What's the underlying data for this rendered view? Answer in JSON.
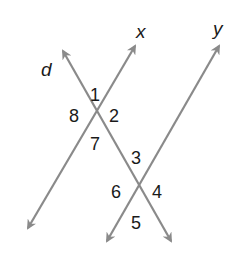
{
  "diagram": {
    "line_color": "#8a8a8a",
    "text_color": "#1a1a1a",
    "lines": [
      {
        "name": "x",
        "label": "x"
      },
      {
        "name": "d",
        "label": "d"
      },
      {
        "name": "y",
        "label": "y"
      }
    ],
    "angles": [
      "1",
      "2",
      "3",
      "4",
      "5",
      "6",
      "7",
      "8"
    ]
  }
}
